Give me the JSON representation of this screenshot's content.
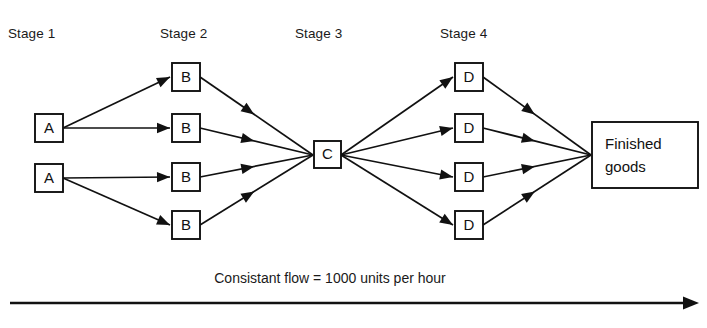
{
  "diagram": {
    "title": "Consistant flow = 1000 units per hour",
    "background_color": "#ffffff",
    "line_color": "#111111",
    "text_color": "#1a1a1a",
    "stage_labels": [
      {
        "text": "Stage 1",
        "x": 8,
        "y": 38
      },
      {
        "text": "Stage 2",
        "x": 160,
        "y": 38
      },
      {
        "text": "Stage 3",
        "x": 295,
        "y": 38
      },
      {
        "text": "Stage 4",
        "x": 440,
        "y": 38
      }
    ],
    "nodes": [
      {
        "id": "a1",
        "label": "A",
        "x": 35,
        "y": 114,
        "w": 28,
        "h": 28
      },
      {
        "id": "a2",
        "label": "A",
        "x": 35,
        "y": 164,
        "w": 28,
        "h": 28
      },
      {
        "id": "b1",
        "label": "B",
        "x": 172,
        "y": 63,
        "w": 28,
        "h": 28
      },
      {
        "id": "b2",
        "label": "B",
        "x": 172,
        "y": 114,
        "w": 28,
        "h": 28
      },
      {
        "id": "b3",
        "label": "B",
        "x": 172,
        "y": 163,
        "w": 28,
        "h": 28
      },
      {
        "id": "b4",
        "label": "B",
        "x": 172,
        "y": 211,
        "w": 28,
        "h": 28
      },
      {
        "id": "c1",
        "label": "C",
        "x": 314,
        "y": 141,
        "w": 27,
        "h": 27
      },
      {
        "id": "d1",
        "label": "D",
        "x": 455,
        "y": 63,
        "w": 28,
        "h": 28
      },
      {
        "id": "d2",
        "label": "D",
        "x": 455,
        "y": 114,
        "w": 28,
        "h": 28
      },
      {
        "id": "d3",
        "label": "D",
        "x": 455,
        "y": 163,
        "w": 28,
        "h": 28
      },
      {
        "id": "d4",
        "label": "D",
        "x": 455,
        "y": 211,
        "w": 28,
        "h": 28
      }
    ],
    "sink": {
      "id": "finished-goods",
      "line1": "Finished",
      "line2": "goods",
      "x": 592,
      "y": 122,
      "w": 106,
      "h": 66
    },
    "edges": [
      {
        "from": "a1",
        "to": "b1",
        "x1": 63,
        "y1": 128,
        "x2": 170,
        "y2": 77,
        "head": "end"
      },
      {
        "from": "a1",
        "to": "b2",
        "x1": 63,
        "y1": 128,
        "x2": 170,
        "y2": 128,
        "head": "end"
      },
      {
        "from": "a2",
        "to": "b3",
        "x1": 63,
        "y1": 178,
        "x2": 170,
        "y2": 177,
        "head": "end"
      },
      {
        "from": "a2",
        "to": "b4",
        "x1": 63,
        "y1": 178,
        "x2": 170,
        "y2": 225,
        "head": "end"
      },
      {
        "from": "b1",
        "to": "c1",
        "x1": 200,
        "y1": 77,
        "x2": 313,
        "y2": 155,
        "head": "mid"
      },
      {
        "from": "b2",
        "to": "c1",
        "x1": 200,
        "y1": 128,
        "x2": 313,
        "y2": 155,
        "head": "mid"
      },
      {
        "from": "b3",
        "to": "c1",
        "x1": 200,
        "y1": 177,
        "x2": 313,
        "y2": 155,
        "head": "mid"
      },
      {
        "from": "b4",
        "to": "c1",
        "x1": 200,
        "y1": 225,
        "x2": 313,
        "y2": 155,
        "head": "mid"
      },
      {
        "from": "c1",
        "to": "d1",
        "x1": 341,
        "y1": 155,
        "x2": 453,
        "y2": 77,
        "head": "end"
      },
      {
        "from": "c1",
        "to": "d2",
        "x1": 341,
        "y1": 155,
        "x2": 453,
        "y2": 128,
        "head": "end"
      },
      {
        "from": "c1",
        "to": "d3",
        "x1": 341,
        "y1": 155,
        "x2": 453,
        "y2": 177,
        "head": "end"
      },
      {
        "from": "c1",
        "to": "d4",
        "x1": 341,
        "y1": 155,
        "x2": 453,
        "y2": 225,
        "head": "end"
      },
      {
        "from": "d1",
        "to": "finished-goods",
        "x1": 483,
        "y1": 77,
        "x2": 591,
        "y2": 155,
        "head": "mid"
      },
      {
        "from": "d2",
        "to": "finished-goods",
        "x1": 483,
        "y1": 128,
        "x2": 591,
        "y2": 155,
        "head": "mid"
      },
      {
        "from": "d3",
        "to": "finished-goods",
        "x1": 483,
        "y1": 177,
        "x2": 591,
        "y2": 155,
        "head": "mid"
      },
      {
        "from": "d4",
        "to": "finished-goods",
        "x1": 483,
        "y1": 225,
        "x2": 591,
        "y2": 155,
        "head": "mid"
      }
    ],
    "caption": {
      "text": "Consistant flow = 1000 units per hour",
      "x": 330,
      "y": 283
    },
    "flow_axis": {
      "x1": 10,
      "x2": 699,
      "y": 303
    }
  }
}
